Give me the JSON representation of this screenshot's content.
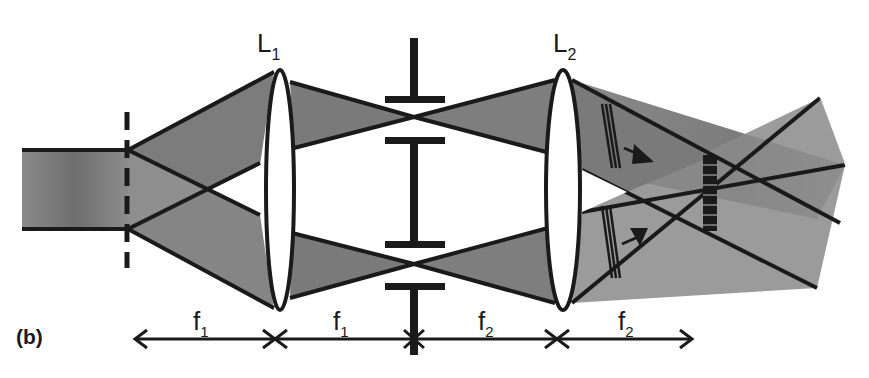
{
  "figure": {
    "panel_label": "(b)"
  },
  "lenses": [
    {
      "id": "L1",
      "label_main": "L",
      "label_sub": "1"
    },
    {
      "id": "L2",
      "label_main": "L",
      "label_sub": "2"
    }
  ],
  "distances": [
    {
      "label_main": "f",
      "label_sub": "1",
      "span": "grating to L1"
    },
    {
      "label_main": "f",
      "label_sub": "1",
      "span": "L1 to Fourier plane"
    },
    {
      "label_main": "f",
      "label_sub": "2",
      "span": "Fourier plane to L2"
    },
    {
      "label_main": "f",
      "label_sub": "2",
      "span": "L2 to image plane"
    }
  ],
  "elements": {
    "input_beam": "collimated input beam",
    "grating": "dashed diffraction grating",
    "fourier_mask": "opaque stop with two apertures",
    "wavefront_markers": "tilted wavefront hatches with propagation arrows",
    "interference_region": "fringe pattern at overlap of the two beams"
  },
  "colors": {
    "beam_fill": "#7a7a7a",
    "beam_fill_light": "#9a9a9a",
    "stroke": "#1a1a1a",
    "background": "#ffffff"
  }
}
